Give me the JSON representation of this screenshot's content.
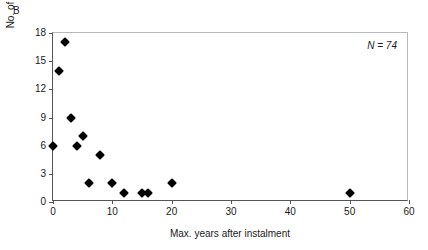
{
  "panel": {
    "letter": "B"
  },
  "annotation": {
    "text": "N = 74"
  },
  "chart_data": {
    "type": "scatter",
    "title": "",
    "xlabel": "Max. years after instalment",
    "ylabel": "No. of references",
    "xlim": [
      0,
      60
    ],
    "ylim": [
      0,
      18
    ],
    "xticks": [
      0,
      10,
      20,
      30,
      40,
      50,
      60
    ],
    "xtick_labels": [
      "0",
      "10",
      "20",
      "30",
      "40",
      "50",
      "60"
    ],
    "yticks": [
      0,
      3,
      6,
      9,
      12,
      15,
      18
    ],
    "ytick_labels": [
      "0",
      "3",
      "6",
      "9",
      "12",
      "15",
      "18"
    ],
    "grid": false,
    "legend": null,
    "marker": "filled-diamond",
    "marker_color": "#000000",
    "series": [
      {
        "name": "references",
        "points": [
          {
            "x": 0,
            "y": 6
          },
          {
            "x": 1,
            "y": 14
          },
          {
            "x": 2,
            "y": 17
          },
          {
            "x": 3,
            "y": 9
          },
          {
            "x": 4,
            "y": 6
          },
          {
            "x": 5,
            "y": 7
          },
          {
            "x": 6,
            "y": 2
          },
          {
            "x": 8,
            "y": 5
          },
          {
            "x": 10,
            "y": 2
          },
          {
            "x": 12,
            "y": 1
          },
          {
            "x": 15,
            "y": 1
          },
          {
            "x": 16,
            "y": 1
          },
          {
            "x": 20,
            "y": 2
          },
          {
            "x": 50,
            "y": 1
          }
        ]
      }
    ]
  }
}
